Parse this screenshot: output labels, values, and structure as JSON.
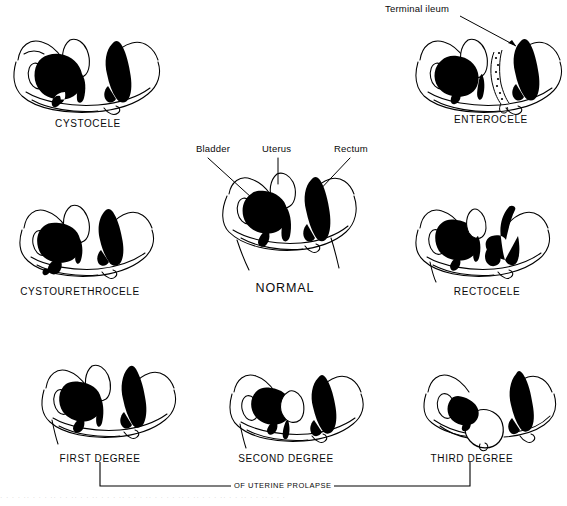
{
  "figure": {
    "ink_color": "#000000",
    "background_color": "#ffffff"
  },
  "panels": [
    {
      "id": "cystocele",
      "label": "CYSTOCELE"
    },
    {
      "id": "enterocele",
      "label": "ENTEROCELE"
    },
    {
      "id": "cystourethrocele",
      "label": "CYSTOURETHROCELE"
    },
    {
      "id": "normal",
      "label": "NORMAL"
    },
    {
      "id": "rectocele",
      "label": "RECTOCELE"
    },
    {
      "id": "first-degree",
      "label": "FIRST DEGREE"
    },
    {
      "id": "second-degree",
      "label": "SECOND DEGREE"
    },
    {
      "id": "third-degree",
      "label": "THIRD DEGREE"
    }
  ],
  "callouts": {
    "terminal_ileum": "Terminal ileum",
    "bladder": "Bladder",
    "uterus": "Uterus",
    "rectum": "Rectum"
  },
  "bracket": {
    "caption": "OF UTERINE PROLAPSE"
  },
  "scan_artifact": {
    "text": "· · ·   ·   ·· ·  ·   · ··  ·   ·  ·· ·   ·  ··   ·  ·   · ·· ·   ·  ·   ·· ·  ·   · ·  ··   ·   ·· ·  ·  ·   ·· ·   ·  ·· ·  ·   ·· ·  ·  ·"
  }
}
